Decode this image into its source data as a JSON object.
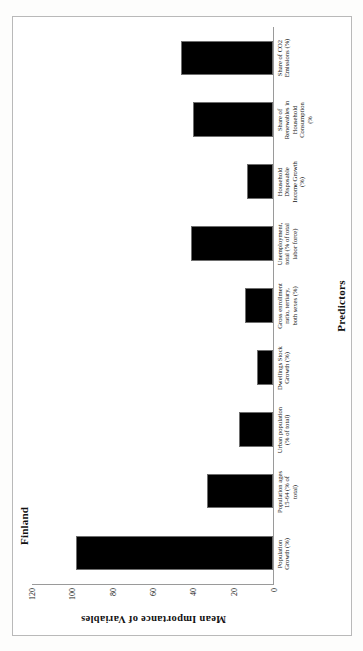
{
  "document": {
    "caption": "Figure 10-6. The mean weighted importance of predictors in Finland's residential sector."
  },
  "chart_data": {
    "type": "bar",
    "title": "Finland",
    "xlabel": "Predictors",
    "ylabel": "Mean Importance  of Variables",
    "ylim": [
      0,
      120
    ],
    "yticks": [
      "0",
      "20",
      "40",
      "60",
      "80",
      "100",
      "120"
    ],
    "grid": false,
    "legend": "none",
    "bar_color": "#000000",
    "categories": [
      "Population\nGrowth (%)",
      "Population ages\n15-64 (% of\ntotal)",
      "Urban population\n(% of total)",
      "Dwellings Stock\nGrowth (%)",
      "Gross enrollment\nratio, tertiary,\nboth sexes (%)",
      "Unemployment,\ntotal (% of total\nlabor force)",
      "Household\nDisposable\nIncome Growth\n(%)",
      "Share of\nRenewables in\nHousehold\nConsumption\n(%",
      "Share of CO2\nEmissions (%)"
    ],
    "values": [
      98,
      33,
      17,
      8,
      14,
      41,
      13,
      40,
      46
    ]
  }
}
